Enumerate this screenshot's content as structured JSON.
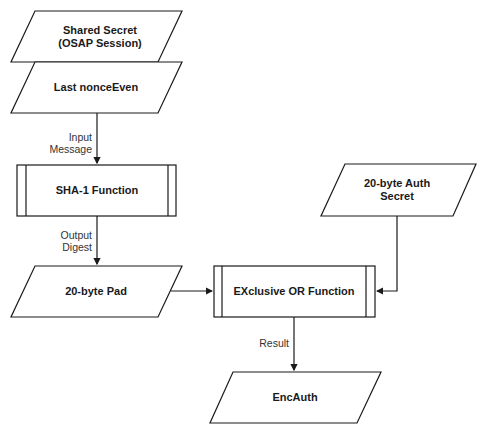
{
  "nodes": {
    "shared_secret": {
      "line1": "Shared Secret",
      "line2": "(OSAP Session)"
    },
    "last_nonce": {
      "label": "Last nonceEven"
    },
    "sha1": {
      "label": "SHA-1 Function"
    },
    "pad": {
      "label": "20-byte Pad"
    },
    "xor": {
      "label": "EXclusive OR Function"
    },
    "auth_secret": {
      "line1": "20-byte Auth",
      "line2": "Secret"
    },
    "encauth": {
      "label": "EncAuth"
    }
  },
  "edges": {
    "input_message": {
      "line1": "Input",
      "line2": "Message"
    },
    "output_digest": {
      "line1": "Output",
      "line2": "Digest"
    },
    "result": {
      "label": "Result"
    }
  },
  "colors": {
    "stroke": "#1a1a1a",
    "background": "#ffffff"
  }
}
